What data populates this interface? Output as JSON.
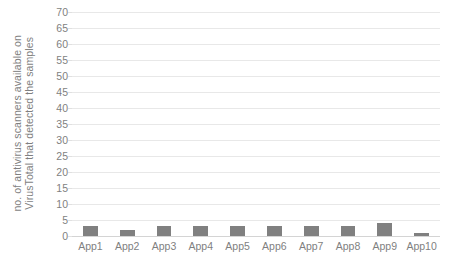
{
  "chart_data": {
    "type": "bar",
    "title": "",
    "subtitle": "",
    "xlabel": "",
    "ylabel_line1": "no. of antivirus scanners available on",
    "ylabel_line2": "VirusTotal that detected the samples",
    "categories": [
      "App1",
      "App2",
      "App3",
      "App4",
      "App5",
      "App6",
      "App7",
      "App8",
      "App9",
      "App10"
    ],
    "values": [
      3,
      2,
      3,
      3,
      3,
      3,
      3,
      3,
      4,
      1
    ],
    "ylim": [
      0,
      70
    ],
    "ytick_step": 5,
    "yticks": [
      0,
      5,
      10,
      15,
      20,
      25,
      30,
      35,
      40,
      45,
      50,
      55,
      60,
      65,
      70
    ],
    "ytick_labels": [
      "0",
      "5",
      "10",
      "15",
      "20",
      "25",
      "30",
      "35",
      "40",
      "45",
      "50",
      "55",
      "60",
      "65",
      "70"
    ],
    "grid": true,
    "grid_axis": "y",
    "legend": false,
    "legend_position": "none",
    "series": [
      {
        "name": "no. of antivirus scanners available on VirusTotal that detected the samples",
        "values": [
          3,
          2,
          3,
          3,
          3,
          3,
          3,
          3,
          4,
          1
        ]
      }
    ],
    "colors": {
      "bar": "#808080",
      "gridline": "#e8e8e8",
      "baseline": "#d4d4d4",
      "text": "#7f7f7f",
      "background": "#ffffff"
    }
  }
}
